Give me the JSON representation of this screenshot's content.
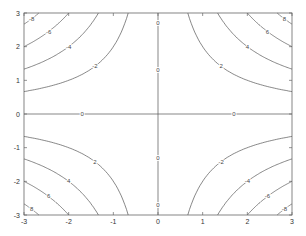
{
  "chart_data": {
    "type": "contour",
    "title": "",
    "xlabel": "",
    "ylabel": "",
    "function": "z = x*y",
    "xlim": [
      -3,
      3
    ],
    "ylim": [
      -3,
      3
    ],
    "xticks": [
      -3,
      -2,
      -1,
      0,
      1,
      2,
      3
    ],
    "yticks": [
      -3,
      -2,
      -1,
      0,
      1,
      2,
      3
    ],
    "levels": [
      -8,
      -6,
      -4,
      -2,
      0,
      2,
      4,
      6,
      8
    ],
    "level_labels": [
      "-8",
      "-6",
      "-4",
      "-2",
      "0",
      "2",
      "4",
      "6",
      "8"
    ],
    "grid": false,
    "line_color": "#555555"
  }
}
